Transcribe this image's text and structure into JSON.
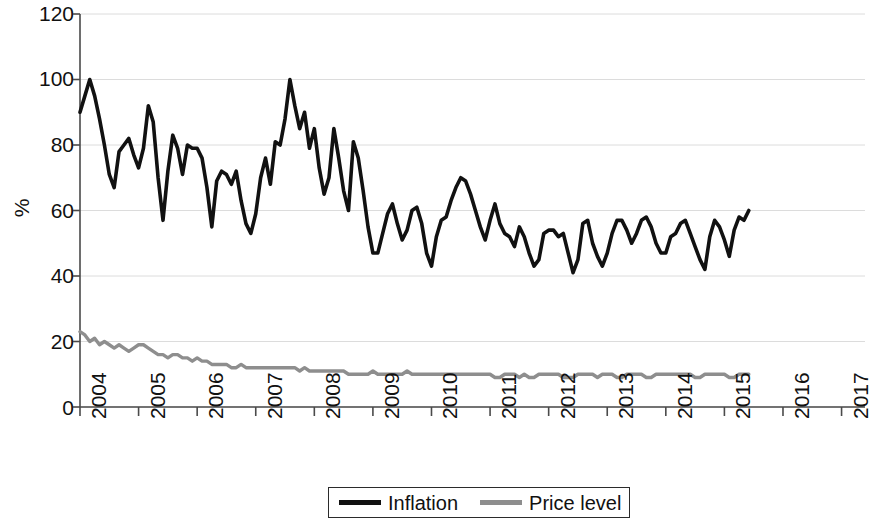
{
  "chart_data": {
    "type": "line",
    "title": "",
    "xlabel": "",
    "ylabel": "%",
    "ylim": [
      0,
      120
    ],
    "yticks": [
      0,
      20,
      40,
      60,
      80,
      100,
      120
    ],
    "xlim": [
      2004.0,
      2017.4
    ],
    "xticks": [
      2004,
      2005,
      2006,
      2007,
      2008,
      2009,
      2010,
      2011,
      2012,
      2013,
      2014,
      2015,
      2016,
      2017
    ],
    "xtick_labels": [
      "2004",
      "2005",
      "2006",
      "2007",
      "2008",
      "2009",
      "2010",
      "2011",
      "2012",
      "2013",
      "2014",
      "2015",
      "2016",
      "2017"
    ],
    "grid": true,
    "grid_axis": "y",
    "legend_position": "bottom",
    "series": [
      {
        "name": "Inflation",
        "color": "#111111",
        "x_start": 2004.0,
        "x_step": 0.0833333,
        "values": [
          90,
          95,
          100,
          95,
          88,
          80,
          71,
          67,
          78,
          80,
          82,
          77,
          73,
          79,
          92,
          87,
          70,
          57,
          72,
          83,
          79,
          71,
          80,
          79,
          79,
          76,
          67,
          55,
          69,
          72,
          71,
          68,
          72,
          63,
          56,
          53,
          59,
          70,
          76,
          68,
          81,
          80,
          88,
          100,
          92,
          85,
          90,
          79,
          85,
          73,
          65,
          70,
          85,
          76,
          66,
          60,
          81,
          76,
          66,
          55,
          47,
          47,
          53,
          59,
          62,
          56,
          51,
          54,
          60,
          61,
          56,
          47,
          43,
          52,
          57,
          58,
          63,
          67,
          70,
          69,
          65,
          60,
          55,
          51,
          57,
          62,
          56,
          53,
          52,
          49,
          55,
          52,
          47,
          43,
          45,
          53,
          54,
          54,
          52,
          53,
          47,
          41,
          45,
          56,
          57,
          50,
          46,
          43,
          47,
          53,
          57,
          57,
          54,
          50,
          53,
          57,
          58,
          55,
          50,
          47,
          47,
          52,
          53,
          56,
          57,
          53,
          49,
          45,
          42,
          52,
          57,
          55,
          51,
          46,
          54,
          58,
          57,
          60
        ]
      },
      {
        "name": "Price level",
        "color": "#8e8e8e",
        "x_start": 2004.0,
        "x_step": 0.0833333,
        "values": [
          23,
          22,
          20,
          21,
          19,
          20,
          19,
          18,
          19,
          18,
          17,
          18,
          19,
          19,
          18,
          17,
          16,
          16,
          15,
          16,
          16,
          15,
          15,
          14,
          15,
          14,
          14,
          13,
          13,
          13,
          13,
          12,
          12,
          13,
          12,
          12,
          12,
          12,
          12,
          12,
          12,
          12,
          12,
          12,
          12,
          11,
          12,
          11,
          11,
          11,
          11,
          11,
          11,
          11,
          11,
          10,
          10,
          10,
          10,
          10,
          11,
          10,
          10,
          10,
          10,
          10,
          10,
          11,
          10,
          10,
          10,
          10,
          10,
          10,
          10,
          10,
          10,
          10,
          10,
          10,
          10,
          10,
          10,
          10,
          10,
          9,
          9,
          10,
          10,
          10,
          9,
          10,
          9,
          9,
          10,
          10,
          10,
          10,
          10,
          9,
          9,
          9,
          10,
          10,
          10,
          10,
          9,
          10,
          10,
          10,
          9,
          9,
          10,
          10,
          10,
          10,
          9,
          9,
          10,
          10,
          10,
          10,
          10,
          10,
          10,
          10,
          9,
          9,
          10,
          10,
          10,
          10,
          10,
          9,
          9,
          10,
          10,
          10
        ]
      }
    ]
  },
  "axis": {
    "y_title": "%",
    "y_tick_labels": [
      "120",
      "100",
      "80",
      "60",
      "40",
      "20",
      "0"
    ]
  },
  "legend": {
    "items": [
      {
        "label": "Inflation",
        "color": "#111111"
      },
      {
        "label": "Price level",
        "color": "#8e8e8e"
      }
    ]
  },
  "colors": {
    "inflation": "#111111",
    "price_level": "#8e8e8e",
    "grid": "#dcdcdc",
    "axis": "#4a4a4a"
  }
}
